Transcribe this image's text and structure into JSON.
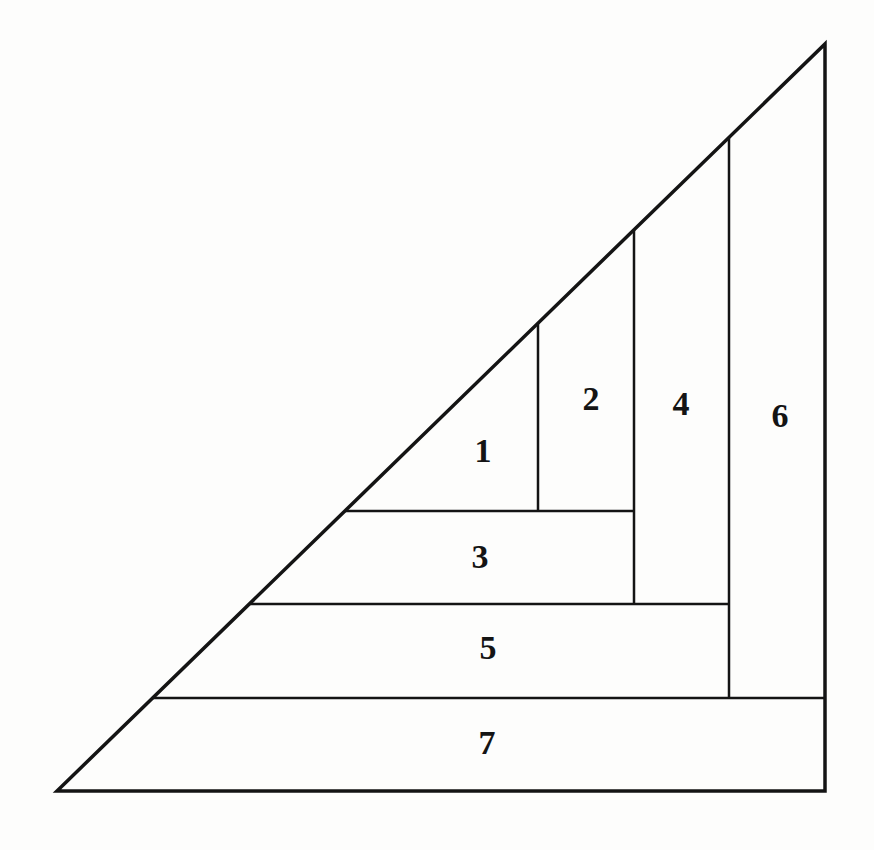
{
  "diagram": {
    "background_color": "#fdfdfc",
    "line_color": "#141414",
    "label_color": "#141414",
    "label_font_size": 34,
    "canvas": {
      "width": 874,
      "height": 850
    },
    "outline": {
      "points": "57,791 825,44 825,791",
      "stroke_width": 3.5
    },
    "segments": [
      {
        "name": "divider-vertical-1",
        "x1": 538,
        "y1": 323,
        "x2": 538,
        "y2": 511,
        "stroke_width": 2.5
      },
      {
        "name": "divider-vertical-2",
        "x1": 634,
        "y1": 230,
        "x2": 634,
        "y2": 604,
        "stroke_width": 2.5
      },
      {
        "name": "divider-vertical-3",
        "x1": 729,
        "y1": 137,
        "x2": 729,
        "y2": 698,
        "stroke_width": 2.5
      },
      {
        "name": "divider-horizontal-1",
        "x1": 345,
        "y1": 511,
        "x2": 634,
        "y2": 511,
        "stroke_width": 2.5
      },
      {
        "name": "divider-horizontal-2",
        "x1": 249,
        "y1": 604,
        "x2": 729,
        "y2": 604,
        "stroke_width": 2.5
      },
      {
        "name": "divider-horizontal-3",
        "x1": 153,
        "y1": 698,
        "x2": 825,
        "y2": 698,
        "stroke_width": 2.5
      }
    ],
    "labels": [
      {
        "text": "1",
        "x": 483,
        "y": 450
      },
      {
        "text": "2",
        "x": 591,
        "y": 398
      },
      {
        "text": "3",
        "x": 480,
        "y": 556
      },
      {
        "text": "4",
        "x": 681,
        "y": 403
      },
      {
        "text": "5",
        "x": 488,
        "y": 647
      },
      {
        "text": "6",
        "x": 780,
        "y": 415
      },
      {
        "text": "7",
        "x": 487,
        "y": 742
      }
    ]
  }
}
